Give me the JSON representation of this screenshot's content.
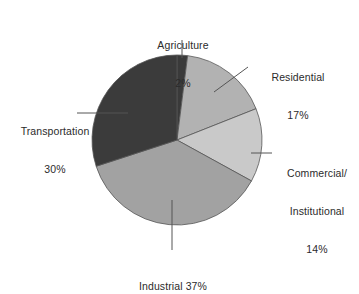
{
  "chart_data": {
    "type": "pie",
    "title": "",
    "subtitle": "",
    "xlabel": "",
    "ylabel": "",
    "legend_position": "none",
    "grid": false,
    "units": "percent",
    "total": 100,
    "start_angle_deg": 0,
    "direction": "clockwise",
    "categories": [
      "Agriculture",
      "Residential",
      "Commercial/Institutional",
      "Industrial",
      "Transportation"
    ],
    "values": [
      2,
      17,
      14,
      37,
      30
    ],
    "slices": [
      {
        "name": "Agriculture",
        "value": 2,
        "value_text": "2%",
        "label_lines": [
          "Agriculture",
          "2%"
        ],
        "color": "#3a3a3a"
      },
      {
        "name": "Residential",
        "value": 17,
        "value_text": "17%",
        "label_lines": [
          "Residential",
          "17%"
        ],
        "color": "#b2b2b2"
      },
      {
        "name": "Commercial/Institutional",
        "value": 14,
        "value_text": "14%",
        "label_lines": [
          "Commercial/",
          "Institutional",
          "14%"
        ],
        "color": "#c9c9c9"
      },
      {
        "name": "Industrial",
        "value": 37,
        "value_text": "37%",
        "label_lines": [
          "Industrial 37%"
        ],
        "color": "#a2a2a2"
      },
      {
        "name": "Transportation",
        "value": 30,
        "value_text": "30%",
        "label_lines": [
          "Transportation",
          "30%"
        ],
        "color": "#3b3b3b"
      }
    ]
  },
  "labels": {
    "agriculture": {
      "line1": "Agriculture",
      "line2": "2%"
    },
    "residential": {
      "line1": "Residential",
      "line2": "17%"
    },
    "commercial": {
      "line1": "Commercial/",
      "line2": "Institutional",
      "line3": "14%"
    },
    "industrial": {
      "line1": "Industrial 37%"
    },
    "transportation": {
      "line1": "Transportation",
      "line2": "30%"
    }
  },
  "style": {
    "background": "#ffffff",
    "slice_outline": "#555555",
    "leader_line": "#555555",
    "text_color": "#2b2b2b"
  }
}
